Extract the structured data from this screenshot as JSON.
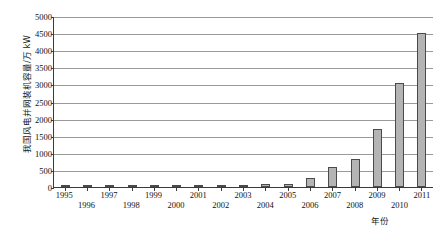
{
  "chart_data": {
    "type": "bar",
    "title": "",
    "subtitle": "",
    "xlabel": "年份",
    "ylabel": "我国风电并网装机容量/万 kW",
    "categories": [
      "1995",
      "1996",
      "1997",
      "1998",
      "1999",
      "2000",
      "2001",
      "2002",
      "2003",
      "2004",
      "2005",
      "2006",
      "2007",
      "2008",
      "2009",
      "2010",
      "2011"
    ],
    "values": [
      4,
      6,
      10,
      22,
      26,
      34,
      40,
      47,
      57,
      76,
      100,
      250,
      580,
      830,
      1700,
      3050,
      4500
    ],
    "series": [
      {
        "name": "我国风电并网装机容量",
        "values": [
          4,
          6,
          10,
          22,
          26,
          34,
          40,
          47,
          57,
          76,
          100,
          250,
          580,
          830,
          1700,
          3050,
          4500
        ]
      }
    ],
    "ylim": [
      0,
      5000
    ],
    "yticks": [
      0,
      500,
      1000,
      1500,
      2000,
      2500,
      3000,
      3500,
      4000,
      4500,
      5000
    ],
    "ytick_labels": [
      "0",
      "500",
      "1000",
      "1500",
      "2000",
      "2500",
      "3000",
      "3500",
      "4000",
      "4500",
      "5000"
    ],
    "grid": true,
    "grid_axis": "y",
    "legend": false,
    "legend_position": "none",
    "bar_color": "#b4b4b4",
    "bar_edge_color": "#4a4a4a",
    "axis_color": "#3a3a3a",
    "gridline_color": "#9a9a9a",
    "background_color": "#ffffff",
    "xtick_label_rows": 2,
    "annotations": []
  }
}
